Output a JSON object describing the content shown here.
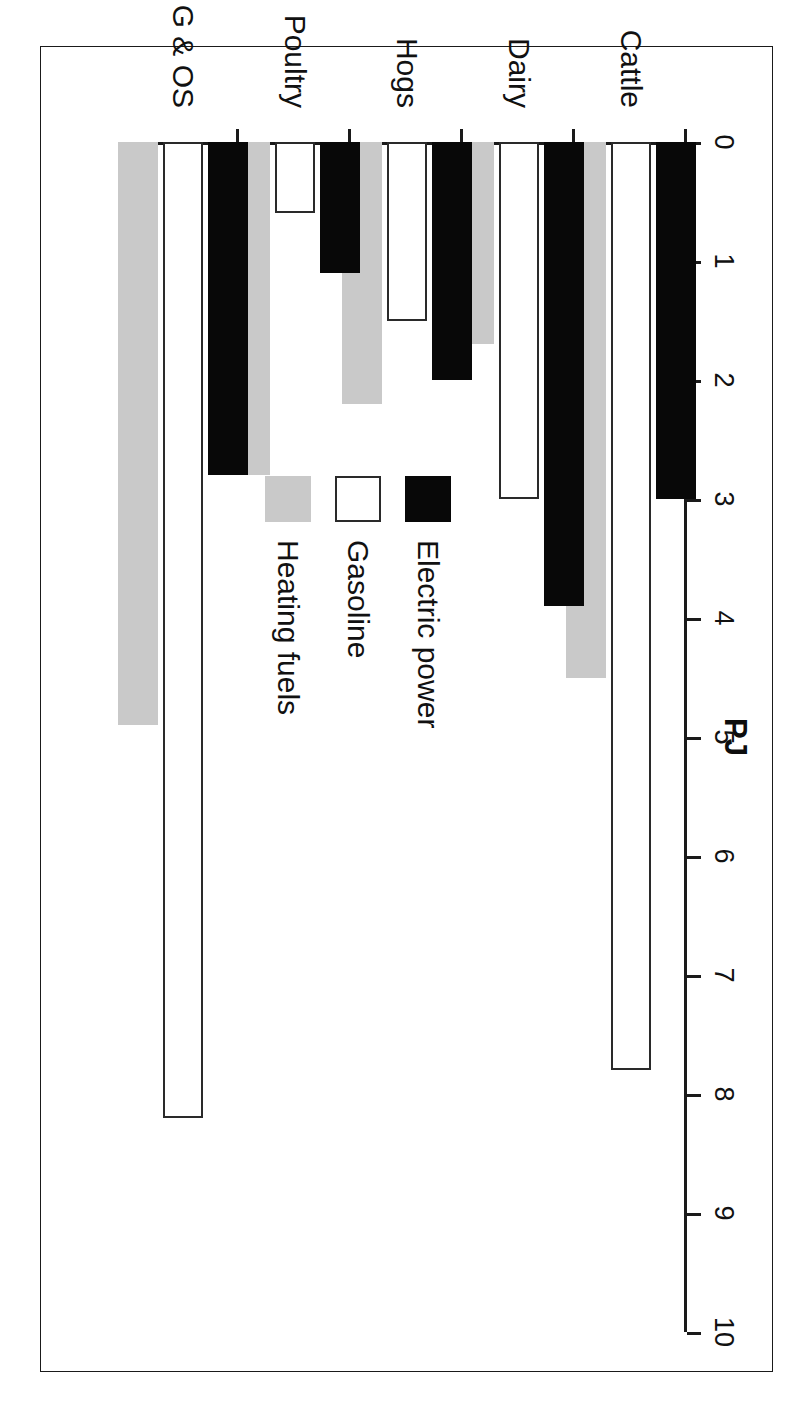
{
  "figure": {
    "rotation_degrees": 90,
    "frame": "thin-black-rectangle"
  },
  "chart_data": {
    "type": "bar",
    "orientation": "grouped-horizontal-rotated",
    "title": "",
    "xlabel": "",
    "ylabel": "PJ",
    "axis_title": "PJ",
    "categories": [
      "Cattle",
      "Dairy",
      "Hogs",
      "Poultry",
      "G & OS"
    ],
    "series": [
      {
        "name": "Electric power",
        "color": "#080808",
        "values": [
          3.0,
          3.9,
          2.0,
          1.1,
          2.8
        ]
      },
      {
        "name": "Gasoline",
        "color": "#ffffff",
        "values": [
          7.8,
          3.0,
          1.5,
          0.6,
          8.2
        ]
      },
      {
        "name": "Heating fuels",
        "color": "#c9c9c9",
        "values": [
          4.5,
          1.7,
          2.2,
          2.8,
          4.9
        ]
      }
    ],
    "ylim": [
      0,
      10
    ],
    "tick_values": [
      0,
      1,
      2,
      3,
      4,
      5,
      6,
      7,
      8,
      9,
      10
    ],
    "tick_labels": [
      "0",
      "1",
      "2",
      "3",
      "4",
      "5",
      "6",
      "7",
      "8",
      "9",
      "10"
    ],
    "grid": false,
    "legend_position": "center"
  },
  "legend": {
    "entries": [
      {
        "label": "Electric power",
        "swatch": "electric"
      },
      {
        "label": "Gasoline",
        "swatch": "gasoline"
      },
      {
        "label": "Heating fuels",
        "swatch": "heating"
      }
    ]
  }
}
